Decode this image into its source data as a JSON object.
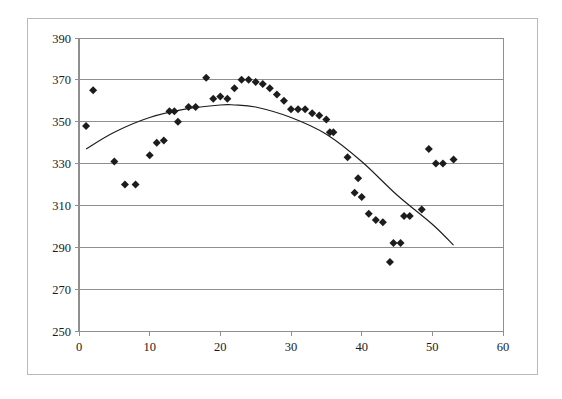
{
  "chart_data": {
    "type": "scatter",
    "title": "",
    "subtitle": "",
    "xlabel": "",
    "ylabel": "",
    "xlim": [
      0,
      60
    ],
    "ylim": [
      250,
      390
    ],
    "x_ticks": [
      0,
      10,
      20,
      30,
      40,
      50,
      60
    ],
    "y_ticks": [
      250,
      270,
      290,
      310,
      330,
      350,
      370,
      390
    ],
    "grid": "horizontal",
    "legend": "none",
    "marker": "diamond",
    "marker_color": "#1c1c1c",
    "series": [
      {
        "name": "observations",
        "type": "scatter",
        "points": [
          [
            1,
            348
          ],
          [
            2,
            365
          ],
          [
            5,
            331
          ],
          [
            6.5,
            320
          ],
          [
            8,
            320
          ],
          [
            10,
            334
          ],
          [
            11,
            340
          ],
          [
            12,
            341
          ],
          [
            12.8,
            355
          ],
          [
            13.5,
            355
          ],
          [
            14,
            350
          ],
          [
            15.5,
            357
          ],
          [
            16.5,
            357
          ],
          [
            18,
            371
          ],
          [
            19,
            361
          ],
          [
            20,
            362
          ],
          [
            21,
            361
          ],
          [
            22,
            366
          ],
          [
            23,
            370
          ],
          [
            24,
            370
          ],
          [
            25,
            369
          ],
          [
            26,
            368
          ],
          [
            27,
            366
          ],
          [
            28,
            363
          ],
          [
            29,
            360
          ],
          [
            30,
            356
          ],
          [
            31,
            356
          ],
          [
            32,
            356
          ],
          [
            33,
            354
          ],
          [
            34,
            353
          ],
          [
            35,
            351
          ],
          [
            35.5,
            345
          ],
          [
            36,
            345
          ],
          [
            38,
            333
          ],
          [
            39,
            316
          ],
          [
            39.5,
            323
          ],
          [
            40,
            314
          ],
          [
            41,
            306
          ],
          [
            42,
            303
          ],
          [
            43,
            302
          ],
          [
            44,
            283
          ],
          [
            44.5,
            292
          ],
          [
            45.5,
            292
          ],
          [
            46,
            305
          ],
          [
            46.8,
            305
          ],
          [
            48.5,
            308
          ],
          [
            49.5,
            337
          ],
          [
            50.5,
            330
          ],
          [
            51.5,
            330
          ],
          [
            53,
            332
          ]
        ]
      },
      {
        "name": "quadratic-trendline",
        "type": "line",
        "points": [
          [
            1,
            337
          ],
          [
            5,
            345
          ],
          [
            10,
            352
          ],
          [
            15,
            356
          ],
          [
            20,
            358
          ],
          [
            22,
            358
          ],
          [
            25,
            357
          ],
          [
            30,
            352
          ],
          [
            35,
            344
          ],
          [
            40,
            331
          ],
          [
            45,
            315
          ],
          [
            50,
            301
          ],
          [
            53,
            291
          ]
        ]
      }
    ]
  }
}
